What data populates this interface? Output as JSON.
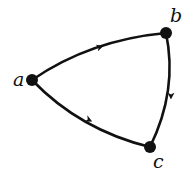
{
  "diagram": {
    "type": "directed-graph",
    "nodes": [
      {
        "id": "a",
        "label": "a",
        "x": 32,
        "y": 80
      },
      {
        "id": "b",
        "label": "b",
        "x": 166,
        "y": 33
      },
      {
        "id": "c",
        "label": "c",
        "x": 150,
        "y": 147
      }
    ],
    "edges": [
      {
        "from": "a",
        "to": "b"
      },
      {
        "from": "b",
        "to": "c"
      },
      {
        "from": "a",
        "to": "c"
      }
    ],
    "colors": {
      "stroke": "#111111",
      "node": "#111111",
      "background": "#ffffff"
    }
  }
}
